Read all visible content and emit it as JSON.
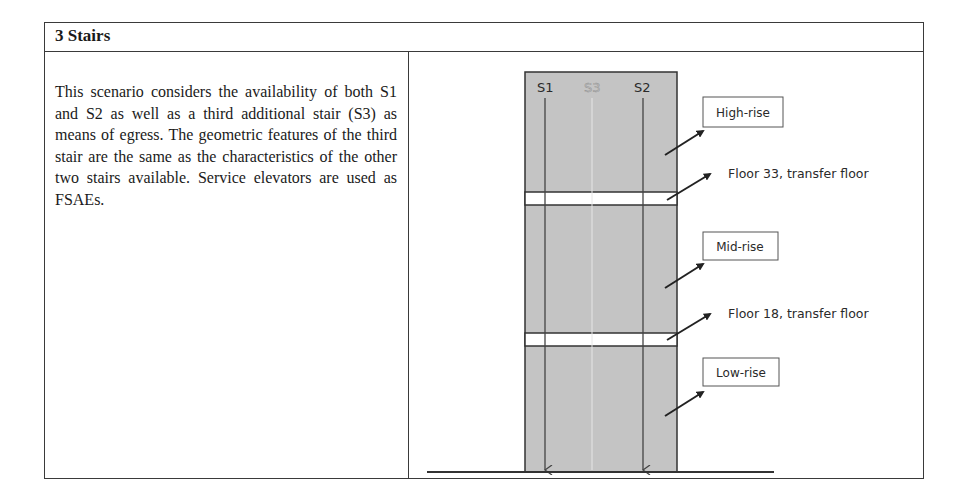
{
  "table": {
    "title": "3 Stairs",
    "description": "This scenario considers the availability of both S1 and S2 as well as a third additional stair (S3) as means of egress. The geometric features of the third stair are the same as the characteristics of the other two stairs available. Service elevators are used as FSAEs."
  },
  "diagram": {
    "stairs": [
      {
        "id": "S1",
        "label": "S1",
        "color": "#3a3a3a"
      },
      {
        "id": "S3",
        "label": "S3",
        "color": "#b8b8b8"
      },
      {
        "id": "S2",
        "label": "S2",
        "color": "#3a3a3a"
      }
    ],
    "zones": {
      "high_rise": "High-rise",
      "mid_rise": "Mid-rise",
      "low_rise": "Low-rise"
    },
    "transfer_floors": {
      "upper": "Floor 33, transfer floor",
      "lower": "Floor 18, transfer floor"
    },
    "colors": {
      "building_fill": "#c4c4c4",
      "band_fill": "#ffffff",
      "line": "#333333"
    }
  }
}
